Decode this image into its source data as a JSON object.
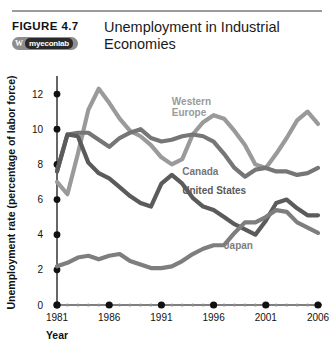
{
  "header": {
    "figure_label": "FIGURE  4.7",
    "title": "Unemployment in Industrial Economies",
    "logo": {
      "mark": "W",
      "text": "myeconlab"
    }
  },
  "chart_data": {
    "type": "line",
    "title": "Unemployment in Industrial Economies",
    "xlabel": "Year",
    "ylabel": "Unemployment rate (percentage of labor force)",
    "xlim": [
      1981,
      2006
    ],
    "ylim": [
      0,
      12.8
    ],
    "yticks": [
      0,
      2,
      4,
      6,
      8,
      10,
      12
    ],
    "xticks": [
      1981,
      1986,
      1991,
      1996,
      2001,
      2006
    ],
    "x": [
      1981,
      1982,
      1983,
      1984,
      1985,
      1986,
      1987,
      1988,
      1989,
      1990,
      1991,
      1992,
      1993,
      1994,
      1995,
      1996,
      1997,
      1998,
      1999,
      2000,
      2001,
      2002,
      2003,
      2004,
      2005,
      2006
    ],
    "grid": false,
    "legend_position": "inline-labels",
    "series": [
      {
        "name": "Western Europe",
        "color": "#9a9a9a",
        "label_x": 1992,
        "label_y": 11.4,
        "values": [
          7.0,
          6.3,
          8.6,
          11.1,
          12.3,
          11.5,
          10.6,
          9.9,
          9.6,
          9.1,
          8.4,
          8.0,
          8.3,
          9.7,
          10.4,
          10.8,
          10.6,
          9.9,
          9.1,
          8.0,
          7.8,
          8.6,
          9.5,
          10.5,
          11.0,
          10.3
        ]
      },
      {
        "name": "Canada",
        "color": "#767676",
        "label_x": 1993,
        "label_y": 7.4,
        "values": [
          7.6,
          9.7,
          9.8,
          9.8,
          9.4,
          9.0,
          9.5,
          9.8,
          10.0,
          9.5,
          9.3,
          9.4,
          9.6,
          9.7,
          9.6,
          9.3,
          8.6,
          7.8,
          7.3,
          7.7,
          7.8,
          7.6,
          7.6,
          7.4,
          7.5,
          7.8
        ]
      },
      {
        "name": "United States",
        "color": "#5b5b5b",
        "label_x": 1993,
        "label_y": 6.3,
        "values": [
          7.6,
          9.7,
          9.6,
          8.1,
          7.5,
          7.2,
          6.7,
          6.2,
          5.8,
          5.6,
          6.9,
          7.4,
          6.9,
          6.1,
          5.6,
          5.4,
          5.0,
          4.6,
          4.3,
          4.0,
          4.8,
          5.8,
          6.0,
          5.5,
          5.1,
          5.1
        ]
      },
      {
        "name": "Japan",
        "color": "#7e7e7e",
        "label_x": 1997,
        "label_y": 3.2,
        "values": [
          2.2,
          2.4,
          2.7,
          2.8,
          2.6,
          2.8,
          2.9,
          2.5,
          2.3,
          2.1,
          2.1,
          2.2,
          2.5,
          2.9,
          3.2,
          3.4,
          3.4,
          4.1,
          4.7,
          4.7,
          5.0,
          5.4,
          5.3,
          4.7,
          4.4,
          4.1
        ]
      }
    ]
  }
}
